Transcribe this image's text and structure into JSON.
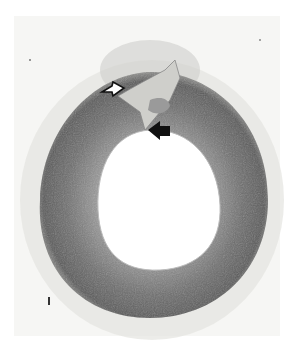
{
  "figure": {
    "annotations": [
      {
        "type": "open-arrow",
        "direction": "right",
        "x": 113,
        "y": 88
      },
      {
        "type": "solid-arrow",
        "direction": "left",
        "x": 160,
        "y": 133
      }
    ],
    "colors": {
      "background": "#f6f6f4",
      "vessel_wall_dark": "#5c5c5c",
      "vessel_wall_mid": "#8a8a8a",
      "lumen": "#ffffff",
      "adventitia": "#d8d8d4"
    }
  }
}
